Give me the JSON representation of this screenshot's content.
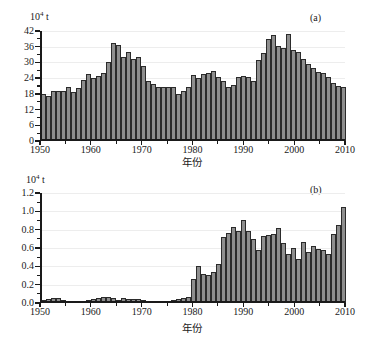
{
  "figure": {
    "background": "#ffffff",
    "bar_fill": "#8e8e8e",
    "bar_stroke": "#2b2b2b",
    "grid_color": "#ededed",
    "axis_color": "#1a1a1a"
  },
  "chart_data": [
    {
      "type": "bar",
      "panel_tag": "(a)",
      "title": "",
      "unit_prefix": "10",
      "unit_exponent": "4",
      "unit_suffix": " t",
      "ylabel": "10⁴ t",
      "xlabel": "年份",
      "ylim": [
        0,
        42
      ],
      "yticks": [
        0,
        6,
        12,
        18,
        24,
        30,
        36,
        42
      ],
      "ytick_labels": [
        "0",
        "6",
        "12",
        "18",
        "24",
        "30",
        "36",
        "42"
      ],
      "yminor_step": 3,
      "xlim": [
        1950,
        2010
      ],
      "xticks": [
        1950,
        1960,
        1970,
        1980,
        1990,
        2000,
        2010
      ],
      "xtick_labels": [
        "1950",
        "1960",
        "1970",
        "1980",
        "1990",
        "2000",
        "2010"
      ],
      "xminor_step": 5,
      "grid": true,
      "legend": "none",
      "x": [
        1950,
        1951,
        1952,
        1953,
        1954,
        1955,
        1956,
        1957,
        1958,
        1959,
        1960,
        1961,
        1962,
        1963,
        1964,
        1965,
        1966,
        1967,
        1968,
        1969,
        1970,
        1971,
        1972,
        1973,
        1974,
        1975,
        1976,
        1977,
        1978,
        1979,
        1980,
        1981,
        1982,
        1983,
        1984,
        1985,
        1986,
        1987,
        1988,
        1989,
        1990,
        1991,
        1992,
        1993,
        1994,
        1995,
        1996,
        1997,
        1998,
        1999,
        2000,
        2001,
        2002,
        2003,
        2004,
        2005,
        2006,
        2007,
        2008,
        2009,
        2010
      ],
      "values": [
        17.8,
        17.2,
        19.2,
        19.0,
        19.2,
        20.5,
        18.8,
        20.2,
        23.3,
        25.4,
        24.1,
        24.7,
        26.0,
        30.1,
        37.4,
        36.8,
        32.1,
        34.0,
        31.5,
        32.1,
        28.6,
        23.0,
        21.8,
        20.6,
        20.8,
        20.5,
        20.6,
        18.1,
        19.1,
        20.5,
        25.1,
        24.2,
        25.4,
        25.9,
        26.6,
        24.5,
        23.1,
        20.6,
        21.2,
        24.5,
        24.7,
        24.5,
        23.1,
        30.8,
        33.7,
        38.8,
        40.3,
        36.4,
        35.6,
        40.8,
        34.7,
        33.8,
        31.3,
        29.3,
        27.9,
        26.2,
        26.1,
        24.6,
        22.2,
        21.0,
        20.6
      ]
    },
    {
      "type": "bar",
      "panel_tag": "(b)",
      "title": "",
      "unit_prefix": "10",
      "unit_exponent": "4",
      "unit_suffix": " t",
      "ylabel": "10⁴ t",
      "xlabel": "年份",
      "ylim": [
        0.0,
        1.2
      ],
      "yticks": [
        0.0,
        0.2,
        0.4,
        0.6,
        0.8,
        1.0,
        1.2
      ],
      "ytick_labels": [
        "0.0",
        "0.2",
        "0.4",
        "0.6",
        "0.8",
        "1.0",
        "1.2"
      ],
      "yminor_step": 0.1,
      "xlim": [
        1950,
        2010
      ],
      "xticks": [
        1950,
        1960,
        1970,
        1980,
        1990,
        2000,
        2010
      ],
      "xtick_labels": [
        "1950",
        "1960",
        "1970",
        "1980",
        "1990",
        "2000",
        "2010"
      ],
      "xminor_step": 5,
      "grid": true,
      "legend": "none",
      "x": [
        1950,
        1951,
        1952,
        1953,
        1954,
        1955,
        1956,
        1957,
        1958,
        1959,
        1960,
        1961,
        1962,
        1963,
        1964,
        1965,
        1966,
        1967,
        1968,
        1969,
        1970,
        1971,
        1972,
        1973,
        1974,
        1975,
        1976,
        1977,
        1978,
        1979,
        1980,
        1981,
        1982,
        1983,
        1984,
        1985,
        1986,
        1987,
        1988,
        1989,
        1990,
        1991,
        1992,
        1993,
        1994,
        1995,
        1996,
        1997,
        1998,
        1999,
        2000,
        2001,
        2002,
        2003,
        2004,
        2005,
        2006,
        2007,
        2008,
        2009,
        2010
      ],
      "values": [
        0.03,
        0.04,
        0.05,
        0.05,
        0.03,
        0.02,
        0.02,
        0.02,
        0.02,
        0.03,
        0.04,
        0.05,
        0.07,
        0.07,
        0.06,
        0.03,
        0.05,
        0.04,
        0.04,
        0.04,
        0.03,
        0.02,
        0.01,
        0.01,
        0.02,
        0.02,
        0.03,
        0.04,
        0.05,
        0.07,
        0.26,
        0.4,
        0.32,
        0.31,
        0.34,
        0.43,
        0.72,
        0.76,
        0.83,
        0.79,
        0.91,
        0.79,
        0.7,
        0.58,
        0.73,
        0.74,
        0.75,
        0.82,
        0.66,
        0.53,
        0.6,
        0.48,
        0.67,
        0.56,
        0.62,
        0.59,
        0.58,
        0.53,
        0.75,
        0.85,
        1.05
      ]
    }
  ]
}
